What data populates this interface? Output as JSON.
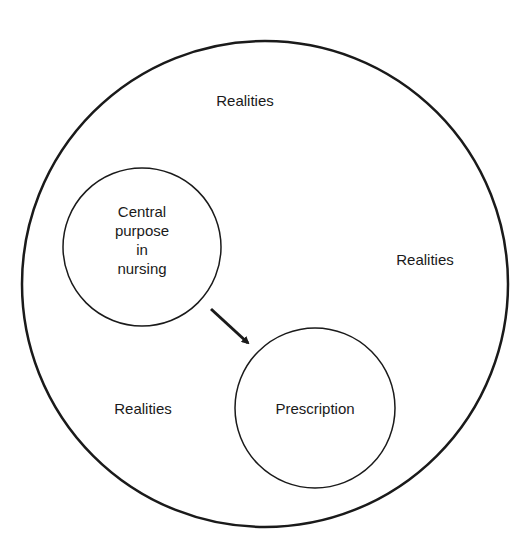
{
  "diagram": {
    "outer_circle": {
      "label_top": "Realities",
      "label_right": "Realities",
      "label_left": "Realities"
    },
    "purpose_circle": {
      "lines": [
        "Central",
        "purpose",
        "in",
        "nursing"
      ]
    },
    "prescription_circle": {
      "label": "Prescription"
    },
    "arrow": {
      "from": "purpose_circle",
      "to": "prescription_circle"
    },
    "colors": {
      "stroke": "#1a1a1a",
      "background": "#ffffff"
    }
  }
}
